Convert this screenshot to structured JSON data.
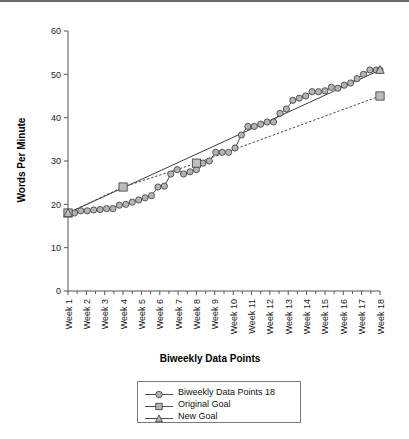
{
  "chart_data": {
    "type": "line",
    "title": "",
    "xlabel": "Biweekly Data Points",
    "ylabel": "Words Per Minute",
    "ylim": [
      0,
      60
    ],
    "yticks": [
      0,
      10,
      20,
      30,
      40,
      50,
      60
    ],
    "ytick_labels": [
      "0",
      "10",
      "20",
      "30",
      "40",
      "50",
      "60"
    ],
    "grid": false,
    "legend_position": "below-plot",
    "categories": [
      "Week 1",
      "Week 2",
      "Week 3",
      "Week 4",
      "Week 5",
      "Week 6",
      "Week 7",
      "Week 8",
      "Week 9",
      "Week 10",
      "Week 11",
      "Week 12",
      "Week 13",
      "Week 14",
      "Week 15",
      "Week 16",
      "Week 17",
      "Week 18"
    ],
    "x_positions": [
      1,
      2,
      3,
      4,
      5,
      6,
      7,
      8,
      9,
      10,
      11,
      12,
      13,
      14,
      15,
      16,
      17,
      18
    ],
    "series": [
      {
        "name": "Biweekly Data Points 18",
        "marker": "circle",
        "line_style": "solid",
        "x": [
          1.0,
          1.35,
          1.7,
          2.05,
          2.4,
          2.75,
          3.1,
          3.45,
          3.8,
          4.15,
          4.5,
          4.85,
          5.2,
          5.55,
          5.9,
          6.25,
          6.6,
          6.95,
          7.3,
          7.65,
          8.0,
          8.35,
          8.7,
          9.05,
          9.4,
          9.75,
          10.1,
          10.45,
          10.8,
          11.15,
          11.5,
          11.85,
          12.2,
          12.55,
          12.9,
          13.25,
          13.6,
          13.95,
          14.3,
          14.65,
          15.0,
          15.35,
          15.7,
          16.05,
          16.4,
          16.75,
          17.1,
          17.45,
          17.8,
          18.0
        ],
        "values": [
          18,
          18,
          18.5,
          18.5,
          18.7,
          18.8,
          19,
          19,
          19.8,
          20,
          20.5,
          21,
          21.5,
          22,
          24,
          24.2,
          27,
          28,
          27,
          27.5,
          28,
          29.5,
          30,
          32,
          32,
          32,
          33,
          36,
          38,
          38,
          38.5,
          39,
          39,
          41,
          42,
          44,
          44.5,
          45,
          46,
          46,
          46.2,
          47,
          46.8,
          47.5,
          48,
          49,
          50,
          51,
          51,
          51
        ]
      },
      {
        "name": "Original Goal",
        "marker": "square",
        "line_style": "dashed",
        "x": [
          1,
          4,
          8,
          18
        ],
        "values": [
          18,
          24,
          29.5,
          45
        ]
      },
      {
        "name": "New Goal",
        "marker": "triangle",
        "line_style": "solid",
        "x": [
          1,
          18
        ],
        "values": [
          18,
          51
        ]
      }
    ],
    "colors": {
      "marker_fill": "#b4b4b4",
      "marker_stroke": "#4a4a4a",
      "line": "#4d4d4d",
      "axis": "#555555",
      "text": "#111111"
    }
  },
  "legend": {
    "entries": [
      {
        "label": "Biweekly Data Points 18",
        "marker": "circle"
      },
      {
        "label": "Original Goal",
        "marker": "square"
      },
      {
        "label": "New Goal",
        "marker": "triangle"
      }
    ]
  }
}
